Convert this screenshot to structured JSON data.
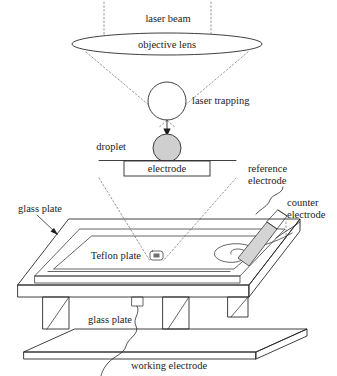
{
  "figure": {
    "background_color": "#ffffff",
    "line_color": "#2a2a2a",
    "dotted_ray_color": "#8d8d8d",
    "grey_fill_color": "#cfcfcf"
  },
  "labels": {
    "laser_beam": "laser beam",
    "objective_lens": "objective lens",
    "laser_trapping": "laser trapping",
    "droplet": "droplet",
    "electrode": "electrode",
    "reference_electrode_line1": "reference",
    "reference_electrode_line2": "electrode",
    "counter_electrode_line1": "counter",
    "counter_electrode_line2": "electrode",
    "glass_plate_top": "glass plate",
    "glass_plate_bottom": "glass plate",
    "teflon_plate": "Teflon plate",
    "working_electrode": "working electrode"
  },
  "icons": {
    "trapping_sphere": "circle-outline-icon",
    "droplet_sphere": "filled-circle-icon",
    "lens_ellipse": "ellipse-icon",
    "down_arrow": "arrow-down-icon",
    "teflon_well": "rounded-rect-well-icon",
    "counter_spiral": "spiral-icon",
    "reference_rod": "angled-rod-icon"
  }
}
